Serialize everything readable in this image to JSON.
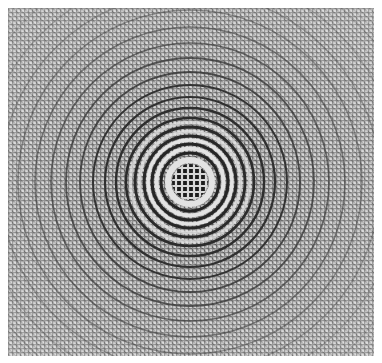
{
  "figure": {
    "background_color": "#ffffff",
    "ink_color": "#1a1a1a",
    "mid_gray": "#9a9a9a",
    "light_gray": "#d8d8d8",
    "center": {
      "x": 190,
      "y": 182
    },
    "central_disc_radius": 18,
    "ring_count_visible": 14
  }
}
